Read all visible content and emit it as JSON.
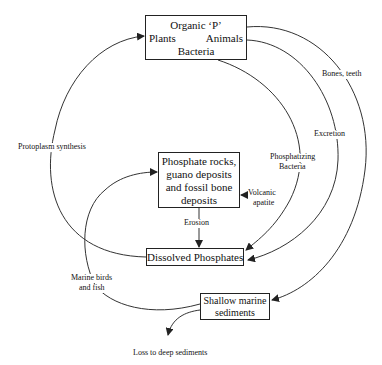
{
  "diagram": {
    "type": "phosphorus-cycle",
    "nodes": {
      "organic_p": {
        "title": "Organic ‘P’",
        "left": "Plants",
        "right": "Animals",
        "bottom": "Bacteria"
      },
      "phosphate_rocks": {
        "line1": "Phosphate rocks,",
        "line2": "guano deposits",
        "line3": "and fossil bone",
        "line4": "deposits"
      },
      "dissolved": {
        "label": "Dissolved Phosphates"
      },
      "shallow": {
        "line1": "Shallow marine",
        "line2": "sediments"
      }
    },
    "edges": {
      "protoplasm": "Protoplasm synthesis",
      "bones": "Bones, teeth",
      "excretion": "Excretion",
      "phosphatizing_1": "Phosphatizing",
      "phosphatizing_2": "Bacteria",
      "volcanic_1": "Volcanic",
      "volcanic_2": "apatite",
      "erosion": "Erosion",
      "marine_1": "Marine birds",
      "marine_2": "and fish",
      "loss": "Loss to deep sediments"
    },
    "colors": {
      "line": "#333333",
      "text": "#111111",
      "background": "#ffffff"
    }
  }
}
